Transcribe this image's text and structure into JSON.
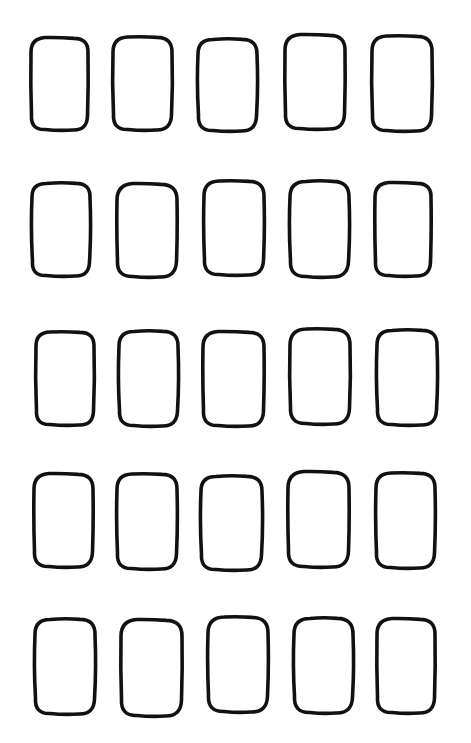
{
  "page": {
    "width": 471,
    "height": 743,
    "background": "#ffffff",
    "stroke_color": "#111111",
    "stroke_width": 3.6
  },
  "grid": {
    "rows": 5,
    "cols": 5,
    "shape_type": "hand-drawn rounded rectangle outline",
    "shapes": [
      [
        {
          "x": 31,
          "y": 38,
          "w": 57,
          "h": 92,
          "r": 14
        },
        {
          "x": 113,
          "y": 37,
          "w": 59,
          "h": 93,
          "r": 15
        },
        {
          "x": 198,
          "y": 39,
          "w": 59,
          "h": 92,
          "r": 15
        },
        {
          "x": 285,
          "y": 35,
          "w": 60,
          "h": 94,
          "r": 15
        },
        {
          "x": 372,
          "y": 36,
          "w": 60,
          "h": 95,
          "r": 15
        }
      ],
      [
        {
          "x": 32,
          "y": 183,
          "w": 58,
          "h": 93,
          "r": 14
        },
        {
          "x": 117,
          "y": 184,
          "w": 60,
          "h": 93,
          "r": 16
        },
        {
          "x": 204,
          "y": 181,
          "w": 60,
          "h": 94,
          "r": 15
        },
        {
          "x": 290,
          "y": 181,
          "w": 59,
          "h": 96,
          "r": 16
        },
        {
          "x": 375,
          "y": 183,
          "w": 56,
          "h": 93,
          "r": 14
        }
      ],
      [
        {
          "x": 36,
          "y": 332,
          "w": 58,
          "h": 93,
          "r": 14
        },
        {
          "x": 119,
          "y": 331,
          "w": 59,
          "h": 95,
          "r": 15
        },
        {
          "x": 203,
          "y": 332,
          "w": 61,
          "h": 94,
          "r": 15
        },
        {
          "x": 290,
          "y": 329,
          "w": 60,
          "h": 95,
          "r": 16
        },
        {
          "x": 377,
          "y": 330,
          "w": 60,
          "h": 95,
          "r": 15
        }
      ],
      [
        {
          "x": 34,
          "y": 474,
          "w": 59,
          "h": 93,
          "r": 15
        },
        {
          "x": 117,
          "y": 474,
          "w": 60,
          "h": 95,
          "r": 15
        },
        {
          "x": 201,
          "y": 476,
          "w": 61,
          "h": 94,
          "r": 15
        },
        {
          "x": 288,
          "y": 472,
          "w": 61,
          "h": 95,
          "r": 16
        },
        {
          "x": 376,
          "y": 473,
          "w": 59,
          "h": 95,
          "r": 15
        }
      ],
      [
        {
          "x": 35,
          "y": 619,
          "w": 60,
          "h": 95,
          "r": 15
        },
        {
          "x": 121,
          "y": 620,
          "w": 61,
          "h": 96,
          "r": 16
        },
        {
          "x": 208,
          "y": 617,
          "w": 60,
          "h": 95,
          "r": 16
        },
        {
          "x": 294,
          "y": 618,
          "w": 59,
          "h": 95,
          "r": 16
        },
        {
          "x": 377,
          "y": 619,
          "w": 58,
          "h": 94,
          "r": 15
        }
      ]
    ]
  }
}
